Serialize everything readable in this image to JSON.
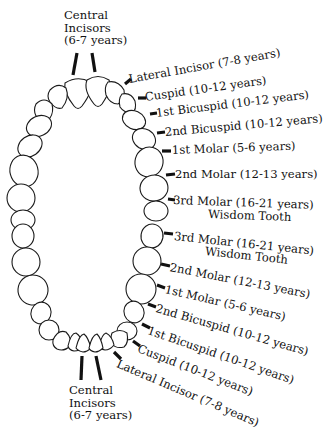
{
  "upper_jaw": {
    "central_incisors": {
      "line1": "Central",
      "line2": "Incisors",
      "line3": "(6-7 years)"
    },
    "labels": [
      {
        "name": "Lateral Incisor",
        "age": "(7-8 years)",
        "text": "Lateral Incisor (7-8 years)"
      },
      {
        "name": "Cuspid",
        "age": "(10-12 years)",
        "text": "Cuspid (10-12 years)"
      },
      {
        "name": "1st Bicuspid",
        "age": "(10-12 years)",
        "text": "1st Bicuspid (10-12 years)"
      },
      {
        "name": "2nd Bicuspid",
        "age": "(10-12 years)",
        "text": "2nd Bicuspid (10-12 years)"
      },
      {
        "name": "1st Molar",
        "age": "(5-6 years)",
        "text": "1st Molar (5-6 years)"
      },
      {
        "name": "2nd Molar",
        "age": "(12-13 years)",
        "text": "2nd Molar (12-13 years)"
      },
      {
        "name": "3rd Molar",
        "age": "(16-21 years)",
        "text": "3rd Molar (16-21 years)",
        "sub": "Wisdom Tooth"
      }
    ]
  },
  "lower_jaw": {
    "central_incisors": {
      "line1": "Central",
      "line2": "Incisors",
      "line3": "(6-7 years)"
    },
    "labels": [
      {
        "name": "3rd Molar",
        "age": "(16-21 years)",
        "text": "3rd Molar (16-21 years)",
        "sub": "Wisdom Tooth"
      },
      {
        "name": "2nd Molar",
        "age": "(12-13 years)",
        "text": "2nd Molar (12-13 years)"
      },
      {
        "name": "1st Molar",
        "age": "(5-6 years)",
        "text": "1st Molar (5-6 years)"
      },
      {
        "name": "2nd Bicuspid",
        "age": "(10-12 years)",
        "text": "2nd Bicuspid (10-12 years)"
      },
      {
        "name": "1st Bicuspid",
        "age": "(10-12 years)",
        "text": "1st Bicuspid (10-12 years)"
      },
      {
        "name": "Cuspid",
        "age": "(10-12 years)",
        "text": "Cuspid (10-12 years)"
      },
      {
        "name": "Lateral Incisor",
        "age": "(7-8 years)",
        "text": "Lateral Incisor (7-8 years)"
      }
    ]
  },
  "colors": {
    "line": "#111111",
    "tooth_fill": "#ffffff",
    "background": "#ffffff"
  }
}
